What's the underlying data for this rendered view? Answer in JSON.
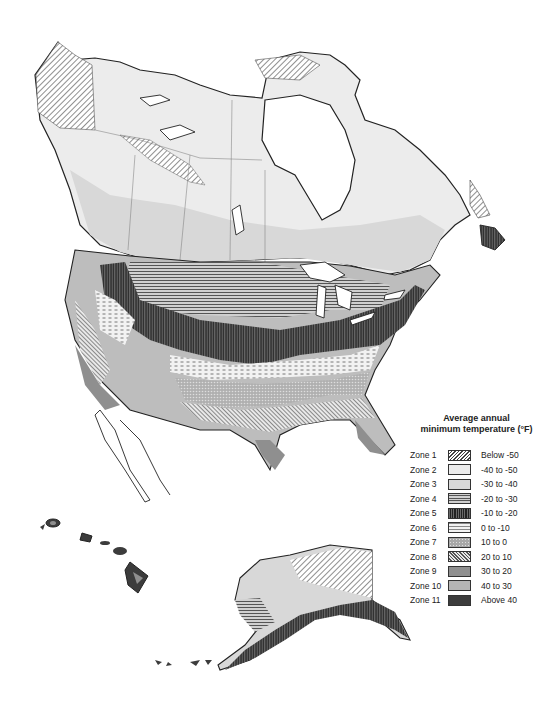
{
  "map": {
    "subject": "Plant hardiness zones of North America",
    "regions": [
      "Canada",
      "Contiguous United States",
      "Alaska",
      "Hawaii",
      "Northern Mexico / Baja California"
    ]
  },
  "legend": {
    "title_line1": "Average annual",
    "title_line2": "minimum temperature (°F)",
    "zones": [
      {
        "label": "Zone 1",
        "range": "Below -50",
        "pattern": "diagonal-hatch",
        "color": "#ffffff"
      },
      {
        "label": "Zone 2",
        "range": "-40 to -50",
        "pattern": "solid",
        "color": "#ececec"
      },
      {
        "label": "Zone 3",
        "range": "-30 to -40",
        "pattern": "solid",
        "color": "#d8d8d8"
      },
      {
        "label": "Zone 4",
        "range": "-20 to -30",
        "pattern": "horizontal-lines",
        "color": "#bdbdbd"
      },
      {
        "label": "Zone 5",
        "range": "-10 to -20",
        "pattern": "vertical-lines",
        "color": "#4a4a4a"
      },
      {
        "label": "Zone 6",
        "range": "0 to -10",
        "pattern": "dashes",
        "color": "#f2f2f2"
      },
      {
        "label": "Zone 7",
        "range": "10 to 0",
        "pattern": "dots",
        "color": "#a8a8a8"
      },
      {
        "label": "Zone 8",
        "range": "20 to 10",
        "pattern": "dense-diagonal",
        "color": "#8c8c8c"
      },
      {
        "label": "Zone 9",
        "range": "30 to 20",
        "pattern": "solid",
        "color": "#8f8f8f"
      },
      {
        "label": "Zone 10",
        "range": "40 to 30",
        "pattern": "solid",
        "color": "#b4b4b4"
      },
      {
        "label": "Zone 11",
        "range": "Above 40",
        "pattern": "solid",
        "color": "#3c3c3c"
      }
    ]
  }
}
